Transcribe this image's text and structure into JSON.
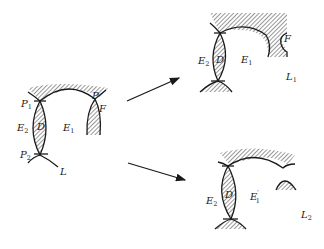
{
  "diagram": {
    "panels": {
      "original": {
        "labels": {
          "P1_main": "P",
          "P1_sub": "1",
          "P2_main": "P",
          "P2_sub": "2",
          "P": "P",
          "F": "F",
          "D": "D",
          "E2_main": "E",
          "E2_sub": "2",
          "E1_main": "E",
          "E1_sub": "1",
          "L": "L"
        }
      },
      "case_1": {
        "labels": {
          "E2_main": "E",
          "E2_sub": "2",
          "D": "D",
          "E1_main": "E",
          "E1_sub": "1",
          "F": "F",
          "L1_main": "L",
          "L1_sub": "1"
        }
      },
      "case_2": {
        "labels": {
          "E2_main": "E",
          "E2_sub": "2",
          "D": "D",
          "E1p_main": "E",
          "E1p_prime": "′",
          "E1p_sub": "1",
          "L2_main": "L",
          "L2_sub": "2"
        }
      }
    },
    "arrows": [
      {
        "from": "original",
        "to": "case_1"
      },
      {
        "from": "original",
        "to": "case_2"
      }
    ],
    "colors": {
      "ink": "#1a1a1a",
      "background": "#ffffff"
    }
  }
}
